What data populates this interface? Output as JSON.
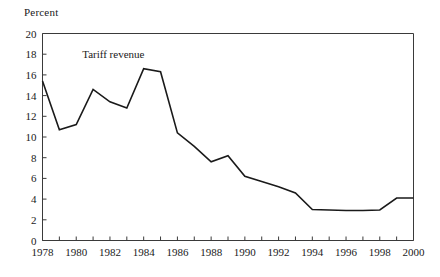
{
  "figure": {
    "y_axis_title": "Percent",
    "annotation": "Tariff revenue"
  },
  "chart_data": {
    "type": "line",
    "title": "",
    "subtitle": "",
    "xlabel": "",
    "ylabel": "Percent",
    "xlim": [
      1978,
      2000
    ],
    "ylim": [
      0,
      20
    ],
    "ytick_step": 2,
    "xtick_step_minor": 1,
    "xtick_step_major": 2,
    "grid": false,
    "legend": "none",
    "annotations": [
      {
        "text": "Tariff revenue",
        "x": 1982.2,
        "y": 17.6
      }
    ],
    "ytick_labels": [
      "0",
      "2",
      "4",
      "6",
      "8",
      "10",
      "12",
      "14",
      "16",
      "18",
      "20"
    ],
    "ytick_values": [
      0,
      2,
      4,
      6,
      8,
      10,
      12,
      14,
      16,
      18,
      20
    ],
    "xtick_labels": [
      "1978",
      "1980",
      "1982",
      "1984",
      "1986",
      "1988",
      "1990",
      "1992",
      "1994",
      "1996",
      "1998",
      "2000"
    ],
    "xtick_values": [
      1978,
      1980,
      1982,
      1984,
      1986,
      1988,
      1990,
      1992,
      1994,
      1996,
      1998,
      2000
    ],
    "x": [
      1978,
      1979,
      1980,
      1981,
      1982,
      1983,
      1984,
      1985,
      1986,
      1987,
      1988,
      1989,
      1990,
      1991,
      1992,
      1993,
      1994,
      1995,
      1996,
      1997,
      1998,
      1999,
      2000
    ],
    "series": [
      {
        "name": "Tariff revenue",
        "color": "#1a1a1a",
        "values": [
          15.4,
          10.7,
          11.2,
          14.6,
          13.4,
          12.8,
          16.6,
          16.3,
          10.4,
          9.1,
          7.6,
          8.2,
          6.2,
          5.7,
          5.2,
          4.6,
          3.0,
          2.95,
          2.9,
          2.9,
          2.95,
          4.1,
          4.1
        ]
      }
    ]
  }
}
